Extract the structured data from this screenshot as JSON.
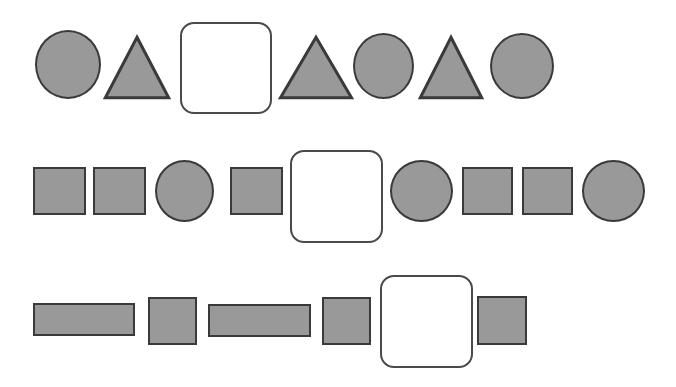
{
  "canvas": {
    "width": 676,
    "height": 387,
    "background": "#ffffff"
  },
  "style": {
    "shape_fill": "#999999",
    "shape_stroke": "#3a3a3a",
    "blank_fill": "#ffffff",
    "blank_stroke": "#4a4a4a",
    "stroke_width": 2,
    "blank_corner_radius": 14
  },
  "puzzle": {
    "type": "visual-sequence-completion",
    "row_count": 3,
    "blank_count": 3
  },
  "rows": [
    {
      "index": 0,
      "top": 0,
      "items": [
        {
          "kind": "circle",
          "label": "circle",
          "x": 35,
          "y": 30,
          "w": 66,
          "h": 69
        },
        {
          "kind": "triangle",
          "label": "triangle",
          "x": 104,
          "y": 36,
          "w": 66,
          "h": 63
        },
        {
          "kind": "blank",
          "label": "blank",
          "x": 180,
          "y": 22,
          "w": 92,
          "h": 92
        },
        {
          "kind": "triangle",
          "label": "triangle",
          "x": 279,
          "y": 36,
          "w": 74,
          "h": 63
        },
        {
          "kind": "circle",
          "label": "circle",
          "x": 353,
          "y": 33,
          "w": 61,
          "h": 66
        },
        {
          "kind": "triangle",
          "label": "triangle",
          "x": 419,
          "y": 36,
          "w": 64,
          "h": 63
        },
        {
          "kind": "circle",
          "label": "circle",
          "x": 490,
          "y": 33,
          "w": 64,
          "h": 66
        }
      ]
    },
    {
      "index": 1,
      "top": 129,
      "items": [
        {
          "kind": "square",
          "label": "square",
          "x": 33,
          "y": 38,
          "w": 53,
          "h": 48
        },
        {
          "kind": "square",
          "label": "square",
          "x": 93,
          "y": 38,
          "w": 53,
          "h": 48
        },
        {
          "kind": "circle",
          "label": "circle",
          "x": 155,
          "y": 31,
          "w": 59,
          "h": 62
        },
        {
          "kind": "square",
          "label": "square",
          "x": 230,
          "y": 38,
          "w": 53,
          "h": 48
        },
        {
          "kind": "blank",
          "label": "blank",
          "x": 290,
          "y": 21,
          "w": 93,
          "h": 93
        },
        {
          "kind": "circle",
          "label": "circle",
          "x": 390,
          "y": 31,
          "w": 63,
          "h": 62
        },
        {
          "kind": "square",
          "label": "square",
          "x": 462,
          "y": 38,
          "w": 51,
          "h": 48
        },
        {
          "kind": "square",
          "label": "square",
          "x": 522,
          "y": 38,
          "w": 51,
          "h": 48
        },
        {
          "kind": "circle",
          "label": "circle",
          "x": 582,
          "y": 31,
          "w": 63,
          "h": 62
        }
      ]
    },
    {
      "index": 2,
      "top": 258,
      "items": [
        {
          "kind": "rectangle",
          "label": "wide-rectangle",
          "x": 33,
          "y": 45,
          "w": 102,
          "h": 33
        },
        {
          "kind": "rectangle",
          "label": "narrow-rectangle",
          "x": 148,
          "y": 39,
          "w": 49,
          "h": 48
        },
        {
          "kind": "rectangle",
          "label": "wide-rectangle",
          "x": 208,
          "y": 46,
          "w": 103,
          "h": 33
        },
        {
          "kind": "rectangle",
          "label": "narrow-rectangle",
          "x": 322,
          "y": 39,
          "w": 49,
          "h": 48
        },
        {
          "kind": "blank",
          "label": "blank",
          "x": 380,
          "y": 17,
          "w": 93,
          "h": 93
        },
        {
          "kind": "rectangle",
          "label": "narrow-rectangle",
          "x": 477,
          "y": 38,
          "w": 50,
          "h": 49
        }
      ]
    }
  ]
}
